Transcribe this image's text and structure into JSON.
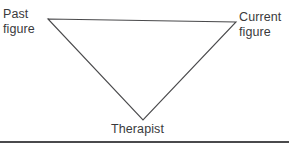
{
  "figure": {
    "type": "triangle-diagram",
    "background_color": "#ffffff",
    "stroke_color": "#4a4a4c",
    "text_color": "#3a3a3c",
    "nodes": [
      {
        "id": "past-figure",
        "label_line_1": "Past",
        "label_line_2": "figure",
        "vertex_x": 48,
        "vertex_y": 19
      },
      {
        "id": "current-figure",
        "label_line_1": "Current",
        "label_line_2": "figure",
        "vertex_x": 236,
        "vertex_y": 22
      },
      {
        "id": "therapist",
        "label_line_1": "Therapist",
        "label_line_2": "",
        "vertex_x": 143,
        "vertex_y": 120
      }
    ],
    "edges": [
      {
        "from": "past-figure",
        "to": "current-figure"
      },
      {
        "from": "current-figure",
        "to": "therapist"
      },
      {
        "from": "therapist",
        "to": "past-figure"
      }
    ],
    "polygon_points": "48,19 236,22 143,120",
    "footer_rule": {
      "present": true,
      "color": "#4a4a4c"
    }
  }
}
